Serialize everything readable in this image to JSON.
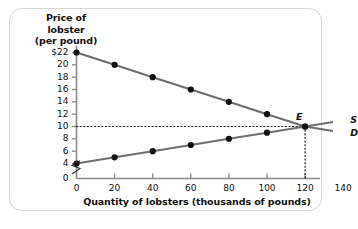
{
  "chart_data": {
    "type": "line",
    "title": "",
    "ylabel_lines": [
      "Price of",
      "lobster",
      "(per pound)"
    ],
    "xlabel": "Quantity of lobsters (thousands of pounds)",
    "xticks": [
      0,
      20,
      40,
      60,
      80,
      100,
      120,
      140
    ],
    "xtick_labels": [
      "0",
      "20",
      "40",
      "60",
      "80",
      "100",
      "120",
      "140"
    ],
    "yticks": [
      4,
      6,
      8,
      10,
      12,
      14,
      16,
      18,
      20,
      22
    ],
    "ytick_labels": [
      "4",
      "6",
      "8",
      "10",
      "12",
      "14",
      "16",
      "18",
      "20",
      "$22"
    ],
    "xlim": [
      0,
      150
    ],
    "ylim": [
      3,
      23
    ],
    "y_axis_break": true,
    "y_axis_break_label": "0",
    "grid": false,
    "legend_position": "right-inline",
    "series": [
      {
        "name": "D",
        "label": "D",
        "color": "#6e6e6e",
        "marker_color": "#111111",
        "points": [
          {
            "x": 0,
            "y": 22
          },
          {
            "x": 20,
            "y": 20
          },
          {
            "x": 40,
            "y": 18
          },
          {
            "x": 60,
            "y": 16
          },
          {
            "x": 80,
            "y": 14
          },
          {
            "x": 100,
            "y": 12
          },
          {
            "x": 120,
            "y": 10
          },
          {
            "x": 140,
            "y": 9
          }
        ]
      },
      {
        "name": "S",
        "label": "S",
        "color": "#6e6e6e",
        "marker_color": "#111111",
        "points": [
          {
            "x": 0,
            "y": 4
          },
          {
            "x": 20,
            "y": 5
          },
          {
            "x": 40,
            "y": 6
          },
          {
            "x": 60,
            "y": 7
          },
          {
            "x": 80,
            "y": 8
          },
          {
            "x": 100,
            "y": 9
          },
          {
            "x": 120,
            "y": 10
          },
          {
            "x": 140,
            "y": 11
          }
        ]
      }
    ],
    "annotations": [
      {
        "name": "equilibrium",
        "label": "E",
        "x": 120,
        "y": 10,
        "guide_lines": [
          "horizontal-to-y-axis",
          "vertical-to-x-axis"
        ],
        "guide_style": "dotted"
      }
    ],
    "colors": {
      "curve": "#6e6e6e",
      "marker": "#111111",
      "axis": "#8a8a8a",
      "frame": "#d8d8d6",
      "text": "#111111",
      "background": "#ffffff"
    }
  }
}
